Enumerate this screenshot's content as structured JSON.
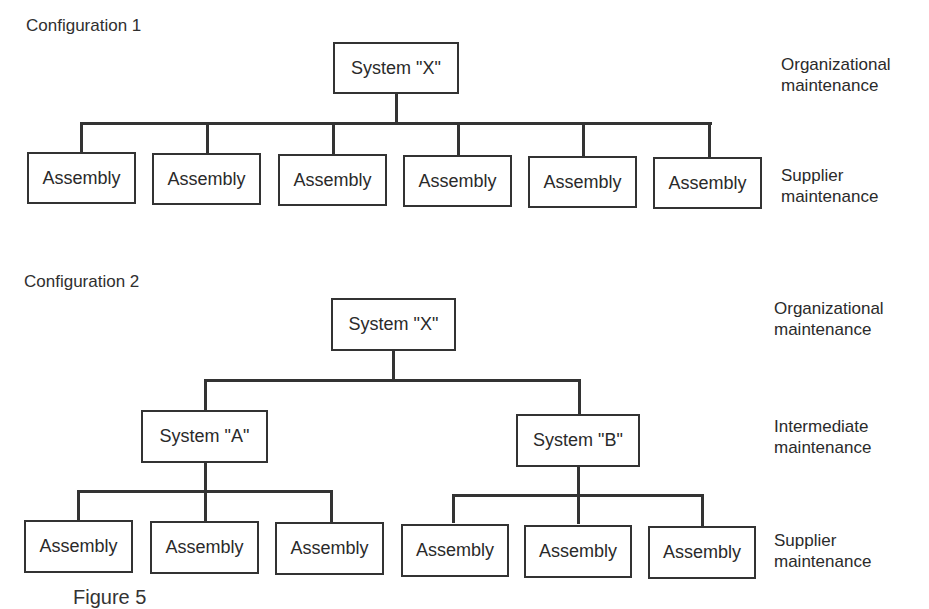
{
  "configuration_1": {
    "title": "Configuration 1",
    "root": "System \"X\"",
    "assemblies": [
      "Assembly",
      "Assembly",
      "Assembly",
      "Assembly",
      "Assembly",
      "Assembly"
    ],
    "levels": [
      {
        "line1": "Organizational",
        "line2": "maintenance"
      },
      {
        "line1": "Supplier",
        "line2": "maintenance"
      }
    ]
  },
  "configuration_2": {
    "title": "Configuration 2",
    "root": "System \"X\"",
    "subsystems": [
      {
        "label": "System \"A\"",
        "assemblies": [
          "Assembly",
          "Assembly",
          "Assembly"
        ]
      },
      {
        "label": "System \"B\"",
        "assemblies": [
          "Assembly",
          "Assembly",
          "Assembly"
        ]
      }
    ],
    "levels": [
      {
        "line1": "Organizational",
        "line2": "maintenance"
      },
      {
        "line1": "Intermediate",
        "line2": "maintenance"
      },
      {
        "line1": "Supplier",
        "line2": "maintenance"
      }
    ]
  },
  "caption_fragment": "Figure 5"
}
